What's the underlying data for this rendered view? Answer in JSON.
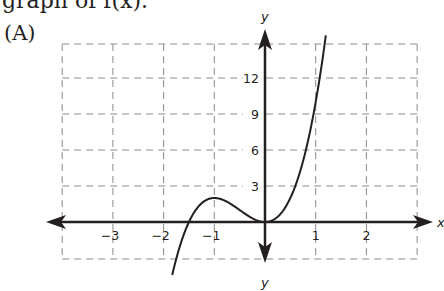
{
  "question": {
    "text": "graph of f(x)."
  },
  "option": {
    "label": "(A)"
  },
  "chart_data": {
    "type": "line",
    "title": "",
    "xlabel": "x",
    "ylabel": "y",
    "xlim": [
      -4,
      3
    ],
    "ylim": [
      -3,
      15
    ],
    "grid": true,
    "x_ticks": [
      "−3",
      "−2",
      "−1",
      "1",
      "2"
    ],
    "y_ticks": [
      "3",
      "6",
      "9",
      "12"
    ],
    "series": [
      {
        "name": "f(x)",
        "function": "4x^3 + 6x^2",
        "x": [
          -1.83,
          -1.75,
          -1.5,
          -1.25,
          -1.0,
          -0.75,
          -0.5,
          -0.25,
          0.0,
          0.25,
          0.5,
          0.75,
          1.0,
          1.1,
          1.2
        ],
        "y": [
          -4.42,
          -3.06,
          0.0,
          1.56,
          2.0,
          1.69,
          1.0,
          0.31,
          0.0,
          0.44,
          2.0,
          5.06,
          10.0,
          12.58,
          15.55
        ]
      }
    ],
    "annotations": {
      "local_max": [
        -1,
        2
      ],
      "local_min": [
        0,
        0
      ],
      "x_intercepts": [
        -1.5,
        0
      ]
    },
    "colors": {
      "curve": "#231f20",
      "axes": "#231f20",
      "grid": "#8a8a8a"
    }
  }
}
